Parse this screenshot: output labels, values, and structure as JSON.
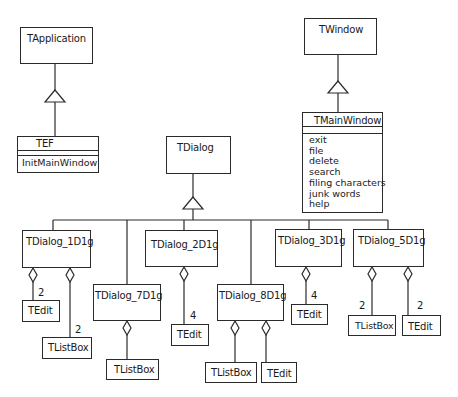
{
  "diagram": {
    "type": "uml-class-diagram",
    "classes": {
      "tapplication": {
        "name": "TApplication"
      },
      "tef": {
        "name": "TEF",
        "operations": [
          "InitMainWindow"
        ]
      },
      "twindow": {
        "name": "TWindow"
      },
      "tmainwindow": {
        "name": "TMainWindow",
        "operations": [
          "exit",
          "file",
          "delete",
          "search",
          "filing characters",
          "junk words",
          "help"
        ]
      },
      "tdialog": {
        "name": "TDialog"
      },
      "d1": {
        "name": "TDialog_1D1g"
      },
      "d2": {
        "name": "TDialog_2D1g"
      },
      "d3": {
        "name": "TDialog_3D1g"
      },
      "d5": {
        "name": "TDialog_5D1g"
      },
      "d7": {
        "name": "TDialog_7D1g"
      },
      "d8": {
        "name": "TDialog_8D1g"
      },
      "d1_edit": {
        "name": "TEdit",
        "multiplicity": "2"
      },
      "d1_list": {
        "name": "TListBox",
        "multiplicity": "2"
      },
      "d2_edit": {
        "name": "TEdit",
        "multiplicity": "4"
      },
      "d3_edit": {
        "name": "TEdit",
        "multiplicity": "4"
      },
      "d5_list": {
        "name": "TListBox",
        "multiplicity": "2"
      },
      "d5_edit": {
        "name": "TEdit",
        "multiplicity": "2"
      },
      "d7_list": {
        "name": "TListBox"
      },
      "d8_list": {
        "name": "TListBox"
      },
      "d8_edit": {
        "name": "TEdit"
      }
    },
    "relationships": [
      {
        "type": "generalization",
        "from": "TEF",
        "to": "TApplication"
      },
      {
        "type": "generalization",
        "from": "TMainWindow",
        "to": "TWindow"
      },
      {
        "type": "generalization",
        "from": [
          "TDialog_1D1g",
          "TDialog_2D1g",
          "TDialog_3D1g",
          "TDialog_5D1g",
          "TDialog_7D1g",
          "TDialog_8D1g"
        ],
        "to": "TDialog"
      },
      {
        "type": "aggregation",
        "whole": "TDialog_1D1g",
        "part": "TEdit",
        "multiplicity": "2"
      },
      {
        "type": "aggregation",
        "whole": "TDialog_1D1g",
        "part": "TListBox",
        "multiplicity": "2"
      },
      {
        "type": "aggregation",
        "whole": "TDialog_2D1g",
        "part": "TEdit",
        "multiplicity": "4"
      },
      {
        "type": "aggregation",
        "whole": "TDialog_3D1g",
        "part": "TEdit",
        "multiplicity": "4"
      },
      {
        "type": "aggregation",
        "whole": "TDialog_5D1g",
        "part": "TListBox",
        "multiplicity": "2"
      },
      {
        "type": "aggregation",
        "whole": "TDialog_5D1g",
        "part": "TEdit",
        "multiplicity": "2"
      },
      {
        "type": "aggregation",
        "whole": "TDialog_7D1g",
        "part": "TListBox"
      },
      {
        "type": "aggregation",
        "whole": "TDialog_8D1g",
        "part": "TListBox"
      },
      {
        "type": "aggregation",
        "whole": "TDialog_8D1g",
        "part": "TEdit"
      }
    ]
  },
  "colors": {
    "line": "#2a2a2a",
    "background": "#ffffff"
  }
}
